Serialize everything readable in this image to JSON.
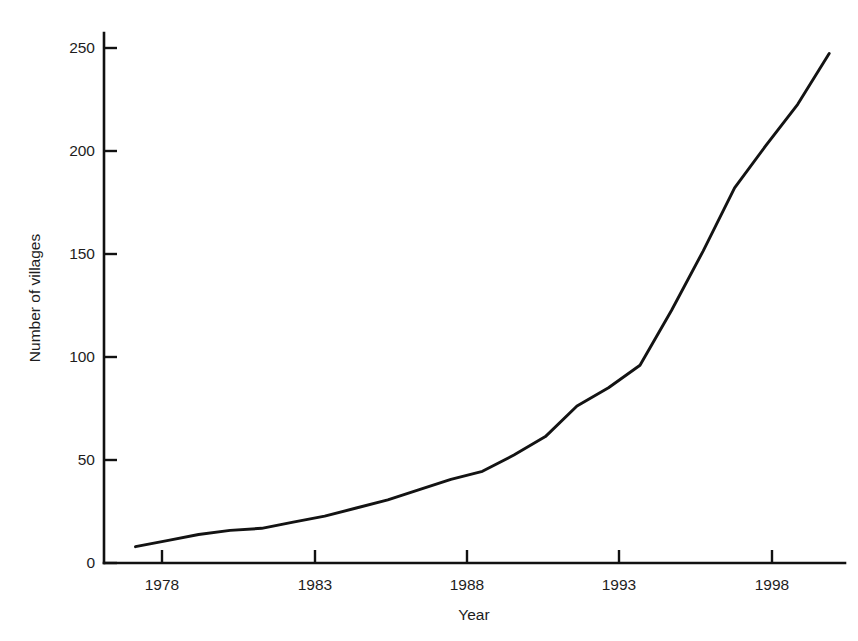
{
  "figure": {
    "background_color": "#ffffff",
    "line_color": "#131313",
    "axis_color": "#111111"
  },
  "axis": {
    "x_title": "Year",
    "y_title": "Number of villages",
    "x_ticks": [
      "1978",
      "1983",
      "1988",
      "1993",
      "1998"
    ],
    "y_ticks": [
      "0",
      "50",
      "100",
      "150",
      "200",
      "250"
    ]
  },
  "chart_data": {
    "type": "line",
    "title": "",
    "xlabel": "Year",
    "ylabel": "Number of villages",
    "xlim": [
      1977,
      2000.5
    ],
    "ylim": [
      0,
      260
    ],
    "xticks": [
      1978,
      1983,
      1988,
      1993,
      1998
    ],
    "yticks": [
      0,
      50,
      100,
      150,
      200,
      250
    ],
    "grid": false,
    "legend": false,
    "x": [
      1978,
      1979,
      1980,
      1981,
      1982,
      1983,
      1984,
      1985,
      1986,
      1987,
      1988,
      1989,
      1990,
      1991,
      1992,
      1993,
      1994,
      1995,
      1996,
      1997,
      1998,
      1999,
      2000
    ],
    "series": [
      {
        "name": "Number of villages",
        "values": [
          8,
          11,
          14,
          16,
          17,
          20,
          23,
          27,
          31,
          36,
          41,
          45,
          53,
          62,
          77,
          86,
          97,
          124,
          153,
          184,
          205,
          225,
          250
        ]
      }
    ]
  }
}
